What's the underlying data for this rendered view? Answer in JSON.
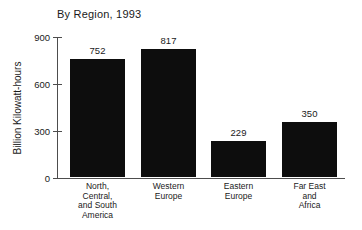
{
  "chart_data": {
    "type": "bar",
    "title": "By Region, 1993",
    "xlabel": "",
    "ylabel": "Billion Kilowatt-hours",
    "categories": [
      "North,\nCentral,\nand South\nAmerica",
      "Western\nEurope",
      "Eastern\nEurope",
      "Far East\nand\nAfrica"
    ],
    "values": [
      752,
      817,
      229,
      350
    ],
    "value_labels": [
      "752",
      "817",
      "229",
      "350"
    ],
    "ylim": [
      0,
      900
    ],
    "yticks": [
      0,
      300,
      600,
      900
    ],
    "ytick_labels": [
      "0",
      "300",
      "600",
      "900"
    ],
    "grid": false,
    "legend": false,
    "bar_color": "#0d0d0d",
    "axis_color": "#4d4d4d",
    "background": "#ffffff"
  }
}
